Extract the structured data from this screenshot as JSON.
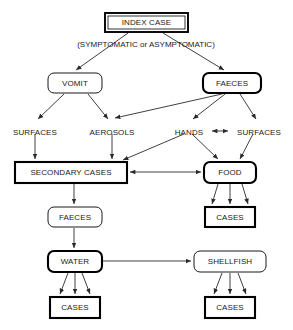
{
  "diagram": {
    "title_node": {
      "id": "index_case",
      "label": "INDEX CASE"
    },
    "subtitle": "(SYMPTOMATIC or ASYMPTOMATIC)",
    "nodes": [
      {
        "id": "index_case",
        "label": "INDEX CASE",
        "x": 105,
        "y": 13,
        "w": 83,
        "h": 19,
        "shape": "rect",
        "border": "double"
      },
      {
        "id": "vomit",
        "label": "VOMIT",
        "x": 48,
        "y": 73,
        "w": 54,
        "h": 20,
        "shape": "rounded",
        "border": "thin"
      },
      {
        "id": "faeces_top",
        "label": "FAECES",
        "x": 203,
        "y": 73,
        "w": 58,
        "h": 20,
        "shape": "rounded",
        "border": "thick"
      },
      {
        "id": "surfaces_left",
        "label": "SURFACES",
        "x": 7,
        "y": 126,
        "w": 56,
        "h": 12,
        "shape": "plain",
        "border": "none"
      },
      {
        "id": "aerosols",
        "label": "AEROSOLS",
        "x": 84,
        "y": 126,
        "w": 56,
        "h": 12,
        "shape": "plain",
        "border": "none"
      },
      {
        "id": "hands",
        "label": "HANDS",
        "x": 169,
        "y": 126,
        "w": 40,
        "h": 12,
        "shape": "plain",
        "border": "none"
      },
      {
        "id": "surfaces_right",
        "label": "SURFACES",
        "x": 231,
        "y": 126,
        "w": 56,
        "h": 12,
        "shape": "plain",
        "border": "none"
      },
      {
        "id": "secondary",
        "label": "SECONDARY CASES",
        "x": 15,
        "y": 162,
        "w": 112,
        "h": 21,
        "shape": "rect",
        "border": "thick"
      },
      {
        "id": "food",
        "label": "FOOD",
        "x": 204,
        "y": 162,
        "w": 52,
        "h": 21,
        "shape": "rounded",
        "border": "thick"
      },
      {
        "id": "faeces_mid",
        "label": "FAECES",
        "x": 48,
        "y": 207,
        "w": 54,
        "h": 20,
        "shape": "rounded",
        "border": "thin"
      },
      {
        "id": "cases_food",
        "label": "CASES",
        "x": 205,
        "y": 207,
        "w": 50,
        "h": 20,
        "shape": "rect",
        "border": "thick"
      },
      {
        "id": "water",
        "label": "WATER",
        "x": 48,
        "y": 251,
        "w": 54,
        "h": 21,
        "shape": "rounded",
        "border": "thick"
      },
      {
        "id": "shellfish",
        "label": "SHELLFISH",
        "x": 194,
        "y": 251,
        "w": 72,
        "h": 21,
        "shape": "rounded",
        "border": "thin"
      },
      {
        "id": "cases_water",
        "label": "CASES",
        "x": 50,
        "y": 297,
        "w": 50,
        "h": 21,
        "shape": "rect",
        "border": "thick"
      },
      {
        "id": "cases_shell",
        "label": "CASES",
        "x": 205,
        "y": 297,
        "w": 50,
        "h": 21,
        "shape": "rect",
        "border": "thick"
      }
    ],
    "edges": [
      {
        "from": "index_case",
        "to": "vomit",
        "x1": 128,
        "y1": 33,
        "x2": 76,
        "y2": 70,
        "arrow": "end"
      },
      {
        "from": "index_case",
        "to": "faeces_top",
        "x1": 163,
        "y1": 33,
        "x2": 224,
        "y2": 70,
        "arrow": "end"
      },
      {
        "from": "vomit",
        "to": "surfaces_left",
        "x1": 64,
        "y1": 94,
        "x2": 38,
        "y2": 119,
        "arrow": "end"
      },
      {
        "from": "vomit",
        "to": "aerosols",
        "x1": 88,
        "y1": 94,
        "x2": 108,
        "y2": 119,
        "arrow": "end"
      },
      {
        "from": "faeces_top",
        "to": "aerosols",
        "x1": 222,
        "y1": 94,
        "x2": 115,
        "y2": 118,
        "arrow": "end"
      },
      {
        "from": "faeces_top",
        "to": "hands",
        "x1": 225,
        "y1": 94,
        "x2": 193,
        "y2": 119,
        "arrow": "end"
      },
      {
        "from": "faeces_top",
        "to": "surfaces_right",
        "x1": 240,
        "y1": 94,
        "x2": 256,
        "y2": 119,
        "arrow": "end"
      },
      {
        "from": "hands",
        "to": "surfaces_right",
        "x1": 212,
        "y1": 131,
        "x2": 228,
        "y2": 131,
        "arrow": "both"
      },
      {
        "from": "surfaces_left",
        "to": "secondary",
        "x1": 35,
        "y1": 134,
        "x2": 35,
        "y2": 159,
        "arrow": "end"
      },
      {
        "from": "aerosols",
        "to": "secondary",
        "x1": 112,
        "y1": 134,
        "x2": 112,
        "y2": 159,
        "arrow": "end"
      },
      {
        "from": "hands",
        "to": "secondary",
        "x1": 184,
        "y1": 134,
        "x2": 123,
        "y2": 160,
        "arrow": "end"
      },
      {
        "from": "hands",
        "to": "food",
        "x1": 192,
        "y1": 134,
        "x2": 218,
        "y2": 159,
        "arrow": "end"
      },
      {
        "from": "surfaces_right",
        "to": "food",
        "x1": 253,
        "y1": 134,
        "x2": 240,
        "y2": 159,
        "arrow": "end"
      },
      {
        "from": "secondary",
        "to": "food",
        "x1": 130,
        "y1": 172,
        "x2": 201,
        "y2": 172,
        "arrow": "both"
      },
      {
        "from": "secondary",
        "to": "faeces_mid",
        "x1": 74,
        "y1": 184,
        "x2": 74,
        "y2": 204,
        "arrow": "end"
      },
      {
        "from": "food",
        "to": "cases_food",
        "x1": 218,
        "y1": 184,
        "x2": 212,
        "y2": 204,
        "arrow": "end"
      },
      {
        "from": "food",
        "to": "cases_food",
        "x1": 230,
        "y1": 184,
        "x2": 230,
        "y2": 204,
        "arrow": "end"
      },
      {
        "from": "food",
        "to": "cases_food",
        "x1": 242,
        "y1": 184,
        "x2": 248,
        "y2": 204,
        "arrow": "end"
      },
      {
        "from": "faeces_mid",
        "to": "water",
        "x1": 74,
        "y1": 228,
        "x2": 74,
        "y2": 248,
        "arrow": "end"
      },
      {
        "from": "water",
        "to": "shellfish",
        "x1": 103,
        "y1": 261,
        "x2": 191,
        "y2": 261,
        "arrow": "end"
      },
      {
        "from": "water",
        "to": "cases_water",
        "x1": 68,
        "y1": 273,
        "x2": 60,
        "y2": 294,
        "arrow": "end"
      },
      {
        "from": "water",
        "to": "cases_water",
        "x1": 75,
        "y1": 273,
        "x2": 75,
        "y2": 294,
        "arrow": "end"
      },
      {
        "from": "water",
        "to": "cases_water",
        "x1": 82,
        "y1": 273,
        "x2": 90,
        "y2": 294,
        "arrow": "end"
      },
      {
        "from": "shellfish",
        "to": "cases_shell",
        "x1": 222,
        "y1": 273,
        "x2": 214,
        "y2": 294,
        "arrow": "end"
      },
      {
        "from": "shellfish",
        "to": "cases_shell",
        "x1": 230,
        "y1": 273,
        "x2": 230,
        "y2": 294,
        "arrow": "end"
      },
      {
        "from": "shellfish",
        "to": "cases_shell",
        "x1": 238,
        "y1": 273,
        "x2": 246,
        "y2": 294,
        "arrow": "end"
      }
    ],
    "colors": {
      "background": "#ffffff",
      "stroke": "#000000",
      "edge": "#2a2a2a",
      "text": "#1a1a1a"
    }
  }
}
